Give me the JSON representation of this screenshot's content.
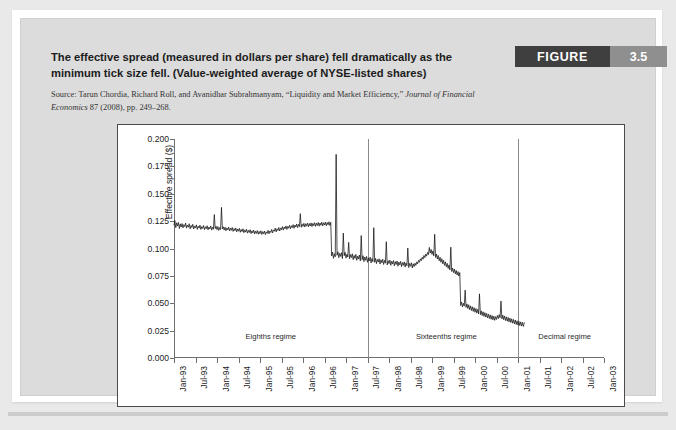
{
  "figure": {
    "badge_word": "FIGURE",
    "badge_number": "3.5",
    "title": "The effective spread (measured in dollars per share) fell dramatically as the minimum tick size fell. (Value-weighted average of NYSE-listed shares)",
    "source_prefix": "Source: Tarun Chordia, Richard Roll, and Avanidhar Subrahmanyam, “Liquidity and Market Efficiency,” ",
    "source_italic": "Journal of Financial Economics",
    "source_suffix": " 87 (2008), pp. 249–268."
  },
  "colors": {
    "badge_dark": "#3f3f3f",
    "badge_gray": "#8f8f8f",
    "panel": "#dcdcdc",
    "page": "#e9e9e9",
    "chart_bg": "#ffffff",
    "series": "#111111",
    "axis": "#6f6f6f"
  },
  "chart_data": {
    "type": "line",
    "title": "",
    "xlabel": "",
    "ylabel": "Effective spread ($)",
    "ylim": [
      0.0,
      0.2
    ],
    "yticks": [
      "0.000",
      "0.025",
      "0.050",
      "0.075",
      "0.100",
      "0.125",
      "0.150",
      "0.175",
      "0.200"
    ],
    "ytick_values": [
      0.0,
      0.025,
      0.05,
      0.075,
      0.1,
      0.125,
      0.15,
      0.175,
      0.2
    ],
    "grid": false,
    "legend": "none",
    "xtick_labels": [
      "Jan-93",
      "Jul-93",
      "Jan-94",
      "Jul-94",
      "Jan-95",
      "Jul-95",
      "Jan-96",
      "Jul-96",
      "Jan-97",
      "Jul-97",
      "Jan-98",
      "Jul-98",
      "Jan-99",
      "Jul-99",
      "Jan-00",
      "Jul-00",
      "Jan-01",
      "Jul-01",
      "Jan-02",
      "Jul-02",
      "Jan-03"
    ],
    "xlim_months": [
      0,
      120
    ],
    "annotations": [
      {
        "text": "Eighths regime",
        "x_month": 27,
        "y": 0.018
      },
      {
        "text": "Sixteenths regime",
        "x_month": 76,
        "y": 0.018
      },
      {
        "text": "Decimal regime",
        "x_month": 109,
        "y": 0.018
      }
    ],
    "regime_dividers": [
      {
        "label": "eighths-to-sixteenths",
        "x_month": 54
      },
      {
        "label": "sixteenths-to-decimal",
        "x_month": 96
      }
    ],
    "series": [
      {
        "name": "Effective spread",
        "x_start_month": 0,
        "x_step_months": 0.25,
        "values": [
          0.1215,
          0.1255,
          0.119,
          0.1235,
          0.1205,
          0.1238,
          0.1182,
          0.1225,
          0.1196,
          0.1228,
          0.1188,
          0.1218,
          0.12,
          0.1232,
          0.1186,
          0.1214,
          0.1195,
          0.1226,
          0.118,
          0.121,
          0.1192,
          0.1221,
          0.1178,
          0.1206,
          0.1188,
          0.1216,
          0.1175,
          0.1204,
          0.1186,
          0.1213,
          0.1174,
          0.12,
          0.1183,
          0.121,
          0.1172,
          0.1198,
          0.118,
          0.1208,
          0.117,
          0.1196,
          0.1179,
          0.1206,
          0.1168,
          0.1194,
          0.1176,
          0.131,
          0.1182,
          0.1203,
          0.1172,
          0.12,
          0.1165,
          0.1192,
          0.1173,
          0.1376,
          0.118,
          0.1198,
          0.1168,
          0.1195,
          0.1162,
          0.1188,
          0.117,
          0.1196,
          0.116,
          0.1186,
          0.1166,
          0.1192,
          0.1156,
          0.1182,
          0.1163,
          0.1188,
          0.1152,
          0.1178,
          0.1158,
          0.1184,
          0.1148,
          0.1174,
          0.1154,
          0.118,
          0.1144,
          0.117,
          0.115,
          0.1176,
          0.114,
          0.1166,
          0.1146,
          0.1172,
          0.1136,
          0.1162,
          0.1142,
          0.1168,
          0.1132,
          0.1158,
          0.1138,
          0.1164,
          0.113,
          0.1156,
          0.1136,
          0.1162,
          0.1128,
          0.1154,
          0.1134,
          0.116,
          0.1126,
          0.1152,
          0.1138,
          0.1166,
          0.1134,
          0.116,
          0.1146,
          0.1174,
          0.1142,
          0.117,
          0.1158,
          0.1186,
          0.1152,
          0.118,
          0.1164,
          0.1192,
          0.116,
          0.1188,
          0.1172,
          0.12,
          0.1168,
          0.1196,
          0.118,
          0.1206,
          0.1174,
          0.1202,
          0.1185,
          0.1212,
          0.118,
          0.1208,
          0.119,
          0.1218,
          0.1184,
          0.1214,
          0.1196,
          0.1224,
          0.119,
          0.122,
          0.12,
          0.1318,
          0.1194,
          0.1222,
          0.1202,
          0.123,
          0.1196,
          0.1226,
          0.1204,
          0.1232,
          0.1198,
          0.1228,
          0.1206,
          0.1234,
          0.12,
          0.1229,
          0.1208,
          0.1236,
          0.1202,
          0.1231,
          0.121,
          0.1238,
          0.1204,
          0.1233,
          0.1212,
          0.124,
          0.1206,
          0.1235,
          0.1214,
          0.1242,
          0.1208,
          0.1237,
          0.1216,
          0.1244,
          0.121,
          0.1239,
          0.0932,
          0.0968,
          0.091,
          0.0952,
          0.0924,
          0.186,
          0.0938,
          0.097,
          0.0916,
          0.0956,
          0.0928,
          0.0962,
          0.0908,
          0.114,
          0.0934,
          0.0966,
          0.0912,
          0.0948,
          0.0922,
          0.1056,
          0.0906,
          0.0944,
          0.0918,
          0.0952,
          0.0898,
          0.0936,
          0.091,
          0.0946,
          0.0892,
          0.093,
          0.0904,
          0.094,
          0.0886,
          0.1118,
          0.0898,
          0.0934,
          0.088,
          0.0922,
          0.0892,
          0.0928,
          0.0874,
          0.0914,
          0.0886,
          0.092,
          0.0868,
          0.0908,
          0.088,
          0.119,
          0.0874,
          0.091,
          0.0862,
          0.09,
          0.0876,
          0.0906,
          0.0858,
          0.0896,
          0.087,
          0.0902,
          0.0854,
          0.0892,
          0.0866,
          0.1062,
          0.085,
          0.0888,
          0.0862,
          0.0894,
          0.0846,
          0.0884,
          0.0858,
          0.089,
          0.0842,
          0.088,
          0.0854,
          0.0886,
          0.0838,
          0.0876,
          0.085,
          0.0882,
          0.0834,
          0.0872,
          0.0846,
          0.0878,
          0.083,
          0.0868,
          0.0842,
          0.1004,
          0.0826,
          0.0864,
          0.0838,
          0.087,
          0.0822,
          0.086,
          0.0834,
          0.0866,
          0.0846,
          0.0878,
          0.086,
          0.0892,
          0.0874,
          0.0906,
          0.0888,
          0.092,
          0.0902,
          0.0936,
          0.0916,
          0.095,
          0.093,
          0.0964,
          0.0944,
          0.101,
          0.0958,
          0.0992,
          0.0946,
          0.0978,
          0.0932,
          0.113,
          0.0918,
          0.095,
          0.0904,
          0.0936,
          0.0888,
          0.092,
          0.0874,
          0.0906,
          0.086,
          0.0892,
          0.0846,
          0.0878,
          0.0832,
          0.0864,
          0.0818,
          0.085,
          0.0804,
          0.1012,
          0.079,
          0.0822,
          0.078,
          0.0812,
          0.0768,
          0.08,
          0.0758,
          0.079,
          0.0748,
          0.078,
          0.048,
          0.0512,
          0.0466,
          0.05,
          0.0474,
          0.062,
          0.0462,
          0.0494,
          0.0452,
          0.0486,
          0.0442,
          0.0476,
          0.0434,
          0.0468,
          0.0426,
          0.046,
          0.0418,
          0.0452,
          0.041,
          0.0444,
          0.0402,
          0.0586,
          0.0396,
          0.043,
          0.0388,
          0.0422,
          0.038,
          0.0414,
          0.0374,
          0.0408,
          0.0366,
          0.04,
          0.036,
          0.0394,
          0.0354,
          0.0388,
          0.0348,
          0.0382,
          0.0344,
          0.0378,
          0.0352,
          0.0388,
          0.036,
          0.0396,
          0.0368,
          0.052,
          0.0358,
          0.0392,
          0.035,
          0.0384,
          0.0342,
          0.0376,
          0.0336,
          0.037,
          0.033,
          0.0364,
          0.0324,
          0.0358,
          0.0318,
          0.0352,
          0.0312,
          0.0346,
          0.0306,
          0.034,
          0.03,
          0.0334,
          0.0296,
          0.033,
          0.0292,
          0.0326,
          0.0288,
          0.0322
        ]
      }
    ]
  }
}
